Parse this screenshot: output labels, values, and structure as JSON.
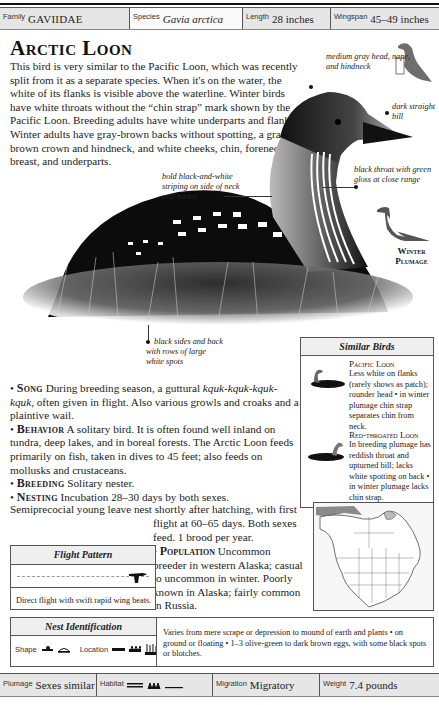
{
  "header": {
    "family_label": "Family",
    "family_value": "GAVIIDAE",
    "species_label": "Species",
    "species_value": "Gavia arctica",
    "length_label": "Length",
    "length_value": "28 inches",
    "wingspan_label": "Wingspan",
    "wingspan_value": "45–49 inches"
  },
  "title": "Arctic Loon",
  "intro": "This bird is very similar to the Pacific Loon, which was recently split from it as a separate species. When it's on the water, the white of its flanks is visible above the waterline. Winter birds have white throats without the “chin strap” mark shown by the Pacific Loon. Breeding adults have white underparts and flanks. Winter adults have gray-brown backs without spotting, a gray-brown crown and hindneck, and white cheeks, chin, foreneck, breast, and underparts.",
  "callouts": {
    "head": "medium gray head, nape, and hindneck",
    "bill": "dark straight bill",
    "throat": "black throat with green gloss at close range",
    "striping": "bold black-and-white striping on side of neck and breast",
    "sides": "black sides and back with rows of large white spots",
    "winter": "Winter Plumage"
  },
  "facts": {
    "song_label": "Song",
    "song_text": "During breeding season, a guttural",
    "song_call": "kquk-kquk-kquk-kquk",
    "song_text2": ", often given in flight. Also various growls and croaks and a plaintive wail.",
    "behavior_label": "Behavior",
    "behavior_text": "A solitary bird. It is often found well inland on tundra, deep lakes, and in boreal forests. The Arctic Loon feeds primarily on fish, taken in dives to 45 feet; also feeds on mollusks and crustaceans.",
    "breeding_label": "Breeding",
    "breeding_text": "Solitary nester.",
    "nesting_label": "Nesting",
    "nesting_text": "Incubation 28–30 days by both sexes.",
    "nesting_text2": "Semiprecocial young leave nest shortly after hatching, with first",
    "nesting_text3": "flight at 60–65 days. Both sexes feed. 1 brood per year.",
    "population_label": "Population",
    "population_text": "Uncommon breeder in western Alaska; casual to uncommon in winter. Poorly known in Alaska; fairly common in Russia."
  },
  "similar_birds": {
    "heading": "Similar Birds",
    "items": [
      {
        "name": "Pacific Loon",
        "text": "Less white on flanks (rarely shows as patch); rounder head • in winter plumage chin strap separates chin from neck."
      },
      {
        "name": "Red-throated Loon",
        "text": "In breeding plumage has reddish throat and upturned bill; lacks white spotting on back • in winter plumage lacks chin strap."
      }
    ]
  },
  "flight_pattern": {
    "heading": "Flight Pattern",
    "text": "Direct flight with swift rapid wing beats."
  },
  "nest": {
    "heading": "Nest Identification",
    "shape_label": "Shape",
    "location_label": "Location",
    "text": "Varies from mere scrape or depression to mound of earth and plants • on ground or floating • 1–3 olive-green to dark brown eggs, with some black spots or blotches."
  },
  "footer": {
    "plumage_label": "Plumage",
    "plumage_value": "Sexes similar",
    "habitat_label": "Habitat",
    "migration_label": "Migration",
    "migration_value": "Migratory",
    "weight_label": "Weight",
    "weight_value": "7.4 pounds"
  },
  "colors": {
    "bar_bg": "#e6e6e6",
    "map_range": "#8a8a8a"
  }
}
